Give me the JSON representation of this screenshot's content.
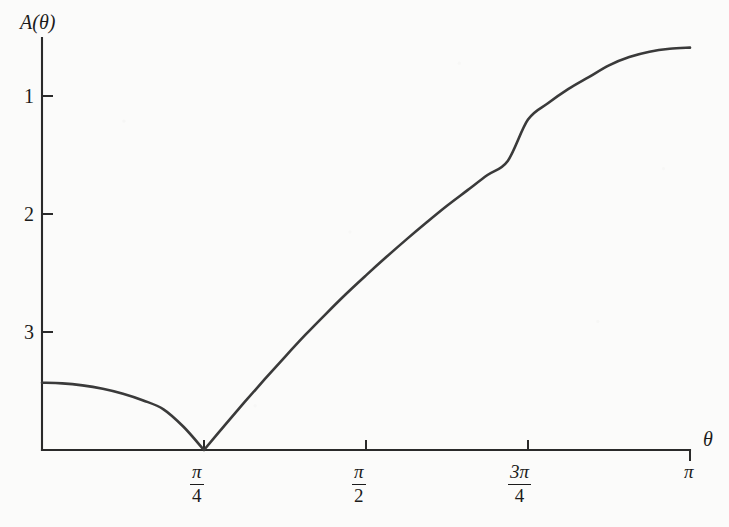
{
  "chart_data": {
    "type": "line",
    "title": "",
    "subtitle": "",
    "xlabel": "θ",
    "ylabel": "A(θ)",
    "grid": false,
    "legend": null,
    "xlim": [
      0,
      3.14159
    ],
    "ylim": [
      0,
      3.7
    ],
    "x_tick_values": [
      0.7854,
      1.5708,
      2.3562,
      3.14159
    ],
    "x_tick_labels": [
      "π/4",
      "π/2",
      "3π/4",
      "π"
    ],
    "y_tick_values": [
      1,
      2,
      3
    ],
    "y_tick_labels": [
      "1",
      "2",
      "3"
    ],
    "series": [
      {
        "name": "A(θ)",
        "color": "#3a3a3a",
        "x": [
          0.0,
          0.0982,
          0.1963,
          0.2945,
          0.3927,
          0.4909,
          0.589,
          0.6872,
          0.7854,
          0.8836,
          0.9817,
          1.0799,
          1.1781,
          1.2763,
          1.3744,
          1.4726,
          1.5708,
          1.669,
          1.7671,
          1.8653,
          1.9635,
          2.0617,
          2.1598,
          2.258,
          2.3562,
          2.4544,
          2.5525,
          2.6507,
          2.7489,
          2.8471,
          2.9452,
          3.0434,
          3.14159
        ],
        "y": [
          0.57,
          0.565,
          0.548,
          0.519,
          0.477,
          0.42,
          0.345,
          0.195,
          0.0,
          0.205,
          0.405,
          0.6,
          0.79,
          0.975,
          1.15,
          1.32,
          1.48,
          1.635,
          1.785,
          1.93,
          2.07,
          2.2,
          2.33,
          2.45,
          2.8,
          2.94,
          3.06,
          3.16,
          3.26,
          3.33,
          3.375,
          3.4,
          3.41
        ],
        "annotations": [
          {
            "label": "cusp minimum",
            "x": 0.7854,
            "y": 0.0
          },
          {
            "label": "left endpoint",
            "x": 0.0,
            "y": 0.57
          },
          {
            "label": "right endpoint",
            "x": 3.14159,
            "y": 3.41
          }
        ]
      }
    ]
  },
  "axes": {
    "y_axis_label": "A(θ)",
    "x_axis_label": "θ",
    "y_ticks": [
      {
        "label": "3"
      },
      {
        "label": "2"
      },
      {
        "label": "1"
      }
    ],
    "x_ticks": [
      {
        "numerator": "π",
        "denominator": "4",
        "fraction": true
      },
      {
        "numerator": "π",
        "denominator": "2",
        "fraction": true
      },
      {
        "numerator": "3π",
        "denominator": "4",
        "fraction": true
      },
      {
        "label": "π",
        "fraction": false
      }
    ]
  },
  "style": {
    "background": "#fbfbfa",
    "axis_color": "#2a2a2a",
    "curve_color": "#3a3a3a",
    "text_color": "#1b1b1b"
  }
}
